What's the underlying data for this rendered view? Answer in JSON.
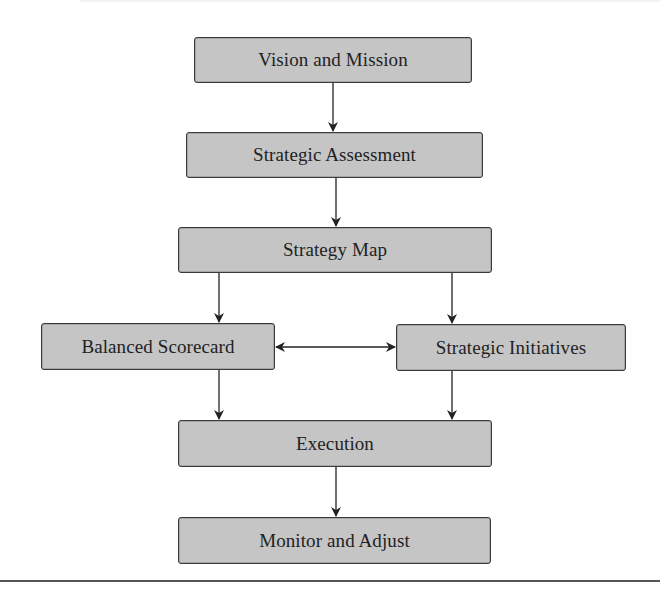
{
  "diagram": {
    "type": "flowchart",
    "nodes": [
      {
        "id": "vision",
        "label": "Vision and Mission",
        "x": 194,
        "y": 37,
        "w": 278,
        "h": 46
      },
      {
        "id": "assessment",
        "label": "Strategic Assessment",
        "x": 186,
        "y": 132,
        "w": 297,
        "h": 46
      },
      {
        "id": "map",
        "label": "Strategy Map",
        "x": 178,
        "y": 227,
        "w": 314,
        "h": 46
      },
      {
        "id": "scorecard",
        "label": "Balanced Scorecard",
        "x": 41,
        "y": 323,
        "w": 234,
        "h": 47
      },
      {
        "id": "initiatives",
        "label": "Strategic Initiatives",
        "x": 396,
        "y": 324,
        "w": 230,
        "h": 47
      },
      {
        "id": "execution",
        "label": "Execution",
        "x": 178,
        "y": 420,
        "w": 314,
        "h": 47
      },
      {
        "id": "monitor",
        "label": "Monitor and Adjust",
        "x": 178,
        "y": 517,
        "w": 313,
        "h": 47
      }
    ],
    "edges": [
      {
        "from": "vision",
        "to": "assessment",
        "direction": "forward"
      },
      {
        "from": "assessment",
        "to": "map",
        "direction": "forward"
      },
      {
        "from": "map",
        "to": "scorecard",
        "direction": "forward"
      },
      {
        "from": "map",
        "to": "initiatives",
        "direction": "forward"
      },
      {
        "from": "scorecard",
        "to": "initiatives",
        "direction": "both"
      },
      {
        "from": "scorecard",
        "to": "execution",
        "direction": "forward"
      },
      {
        "from": "initiatives",
        "to": "execution",
        "direction": "forward"
      },
      {
        "from": "execution",
        "to": "monitor",
        "direction": "forward"
      }
    ],
    "colors": {
      "node_fill": "#c5c5c5",
      "node_border": "#3a3a3a",
      "edge": "#222222",
      "text": "#222222"
    }
  }
}
